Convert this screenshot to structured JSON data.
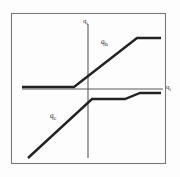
{
  "figure": {
    "kind": "line-diagram",
    "frame": {
      "x": 11,
      "y": 13,
      "width": 154,
      "height": 150
    },
    "colors": {
      "ink": "#232323",
      "axis": "#555555",
      "frame": "#777777",
      "background": "#fdfdfd"
    }
  },
  "axes": {
    "vertical": {
      "label": "q",
      "subscript": "i",
      "x": 88,
      "y_top": 24,
      "y_bottom": 158
    },
    "horizontal": {
      "label": "q",
      "subscript": "i",
      "y": 89,
      "x_left": 22,
      "x_right": 163
    }
  },
  "curves": [
    {
      "name": "q-h",
      "label": "q",
      "subscript": "h",
      "label_x": 101,
      "label_y": 38,
      "points": [
        {
          "x": 22,
          "y": 87
        },
        {
          "x": 74,
          "y": 87
        },
        {
          "x": 137,
          "y": 38
        },
        {
          "x": 161,
          "y": 38
        }
      ]
    },
    {
      "name": "q-c",
      "label": "q",
      "subscript": "c",
      "label_x": 50,
      "label_y": 112,
      "points": [
        {
          "x": 28,
          "y": 158
        },
        {
          "x": 92,
          "y": 99
        },
        {
          "x": 125,
          "y": 99
        },
        {
          "x": 140,
          "y": 93
        },
        {
          "x": 161,
          "y": 93
        }
      ]
    }
  ],
  "chart_data": {
    "type": "line",
    "title": "",
    "xlabel": "q_i",
    "ylabel": "q_i",
    "grid": false,
    "legend": "inline-annotations",
    "series": [
      {
        "name": "q_h",
        "x": [
          22,
          74,
          137,
          161
        ],
        "y": [
          87,
          87,
          38,
          38
        ],
        "shape": "saturating-ramp-up"
      },
      {
        "name": "q_c",
        "x": [
          28,
          92,
          125,
          140,
          161
        ],
        "y": [
          158,
          99,
          99,
          93,
          93
        ],
        "shape": "ramp-then-step"
      }
    ],
    "annotations": [
      "q_h",
      "q_c",
      "q_i",
      "q_i"
    ]
  }
}
